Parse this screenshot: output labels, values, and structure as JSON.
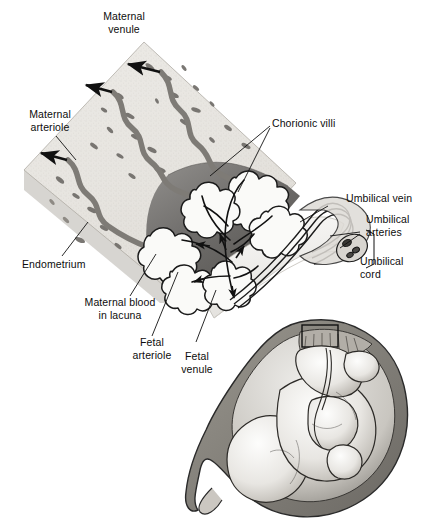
{
  "figure": {
    "background_color": "#ffffff",
    "ink_color": "#0d0d0d",
    "style": "grayscale medical illustration"
  },
  "labels": {
    "maternal_venule": "Maternal\nvenule",
    "maternal_arteriole": "Maternal\narteriole",
    "endometrium": "Endometrium",
    "chorionic_villi": "Chorionic villi",
    "umbilical_vein": "Umbilical vein",
    "umbilical_arteries": "Umbilical\narteries",
    "umbilical_cord": "Umbilical\ncord",
    "maternal_blood_in_lacuna": "Maternal blood\nin lacuna",
    "fetal_arteriole": "Fetal\narteriole",
    "fetal_venule": "Fetal\nvenule"
  },
  "structures": [
    {
      "name": "endometrium-slab",
      "description": "tilted stippled light-gray block of uterine lining with dark oval glands"
    },
    {
      "name": "maternal-vessels",
      "description": "three wavy gray spiral vessels with black arrowheads indicating blood flow"
    },
    {
      "name": "intervillous-lacuna",
      "description": "dark gray pool of maternal blood surrounding the villi"
    },
    {
      "name": "chorionic-villi-tree",
      "description": "white outlined branching villous tree with fetal capillaries"
    },
    {
      "name": "chorionic-plate",
      "description": "pale membrane layer at the fetal surface of the placenta"
    },
    {
      "name": "umbilical-cord",
      "description": "twisted cord containing one umbilical vein and two umbilical arteries"
    },
    {
      "name": "fetus-in-utero-inset",
      "description": "fetus curled inside the uterus with placenta at the top; small rectangle marks the magnified region"
    }
  ]
}
